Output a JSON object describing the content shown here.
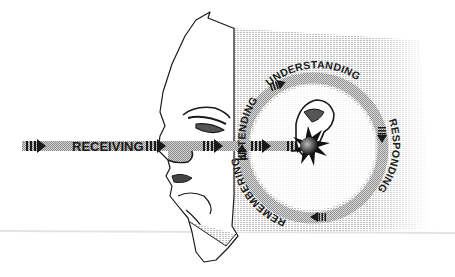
{
  "diagram": {
    "type": "listening-process",
    "input_label": "RECEIVING",
    "cycle": {
      "stages": [
        "ATTENDING",
        "UNDERSTANDING",
        "RESPONDING",
        "REMEMBERING"
      ]
    },
    "colors": {
      "ink": "#1a1a1a",
      "band": "#b8b8b8",
      "hatch": "#c8c8c8",
      "background": "#ffffff"
    }
  }
}
